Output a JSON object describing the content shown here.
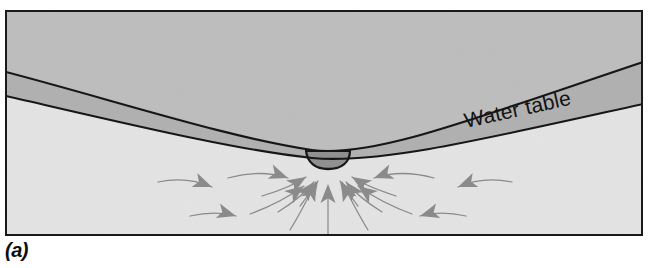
{
  "figure": {
    "panel_label": "(a)",
    "water_table_label": "Water table",
    "caption_note": ""
  },
  "colors": {
    "unsaturated_zone": "#bdbdbd",
    "water_table_band": "#b0b0b0",
    "saturated_zone": "#e3e3e3",
    "lake_water": "#8f8f8f",
    "arrow_gray": "#8a8a8a",
    "outline_black": "#141414",
    "frame_border": "#1a1a1a",
    "page_background": "#ffffff",
    "label_text": "#0d0d0d"
  },
  "frame": {
    "x": 5,
    "y": 10,
    "width": 638,
    "height": 226,
    "border_width": 2
  },
  "geometry": {
    "water_table_top_line": "M 6,72 C 120,102 230,138 312,150 C 372,158 470,120 643,62",
    "water_table_bottom_line": "M 6,96 C 120,122 235,150 312,158 C 380,164 480,140 643,104",
    "lake_top_y": 151,
    "lake_left_x": 307,
    "lake_right_x": 349,
    "lake_bottom_y": 167
  },
  "flow_arrows": {
    "description": "Converging groundwater flow lines toward the lake",
    "count": 17,
    "vertical_center_arrow": {
      "from_y": 238,
      "to_y": 184,
      "x": 328
    }
  },
  "legend_items": []
}
